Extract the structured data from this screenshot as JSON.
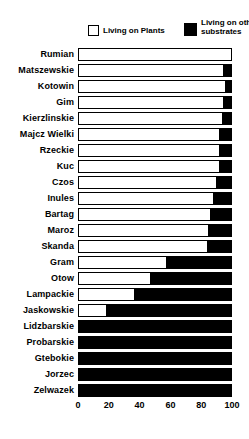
{
  "legend": {
    "plants_label": "Living on Plants",
    "substrates_label_line1": "Living on other",
    "substrates_label_line2": "substrates",
    "plants_color": "#ffffff",
    "substrates_color": "#000000"
  },
  "chart_data": {
    "type": "bar",
    "orientation": "horizontal",
    "stacked": true,
    "title": "",
    "xlabel": "",
    "ylabel": "",
    "xlim": [
      0,
      100
    ],
    "x_ticks": [
      0,
      20,
      40,
      60,
      80,
      100
    ],
    "grid": false,
    "legend_position": "top",
    "categories": [
      "Rumian",
      "Matszewskie",
      "Kotowin",
      "Gim",
      "Kierzlinskie",
      "Majcz Wielki",
      "Rzeckie",
      "Kuc",
      "Czos",
      "Inules",
      "Bartag",
      "Maroz",
      "Skanda",
      "Gram",
      "Otow",
      "Lampackie",
      "Jaskowskie",
      "Lidzbarskie",
      "Probarskie",
      "Gtebokie",
      "Jorzec",
      "Zelwazek"
    ],
    "series": [
      {
        "name": "Living on Plants",
        "color": "#ffffff",
        "values": [
          100,
          95,
          96,
          95,
          94,
          92,
          92,
          92,
          90,
          88,
          86,
          85,
          84,
          57,
          47,
          36,
          18,
          0,
          0,
          0,
          0,
          0
        ]
      },
      {
        "name": "Living on other substrates",
        "color": "#000000",
        "values": [
          0,
          5,
          4,
          5,
          6,
          8,
          8,
          8,
          10,
          12,
          14,
          15,
          16,
          43,
          53,
          64,
          82,
          100,
          100,
          100,
          100,
          100
        ]
      }
    ]
  }
}
